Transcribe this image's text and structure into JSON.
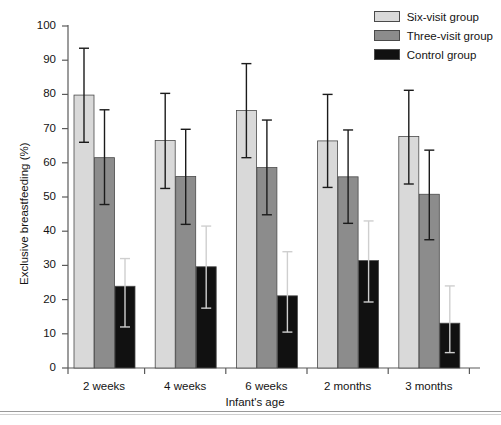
{
  "chart_data": {
    "type": "bar",
    "title": "",
    "xlabel": "Infant's age",
    "ylabel": "Exclusive breastfeeding (%)",
    "ylim": [
      0,
      100
    ],
    "ytick_step": 10,
    "yticks": [
      0,
      10,
      20,
      30,
      40,
      50,
      60,
      70,
      80,
      90,
      100
    ],
    "grid": false,
    "legend_position": "top-right",
    "categories": [
      "2 weeks",
      "4 weeks",
      "6 weeks",
      "2 months",
      "3 months"
    ],
    "series": [
      {
        "name": "Six-visit group",
        "color": "#d9d9d9",
        "values": [
          79.8,
          66.5,
          75.3,
          66.4,
          67.7
        ],
        "error_low": [
          66.0,
          52.5,
          61.5,
          52.8,
          53.8
        ],
        "error_high": [
          93.5,
          80.3,
          89.0,
          80.0,
          81.2
        ]
      },
      {
        "name": "Three-visit group",
        "color": "#8c8c8c",
        "values": [
          61.5,
          56.0,
          58.6,
          55.9,
          50.8
        ],
        "error_low": [
          47.8,
          42.0,
          44.8,
          42.3,
          37.5
        ],
        "error_high": [
          75.5,
          69.8,
          72.5,
          69.6,
          63.7
        ]
      },
      {
        "name": "Control group",
        "color": "#111111",
        "values": [
          23.9,
          29.6,
          21.1,
          31.4,
          13.1
        ],
        "error_low": [
          12.0,
          17.5,
          10.5,
          19.3,
          4.5
        ],
        "error_high": [
          32.0,
          41.5,
          34.0,
          43.0,
          24.0
        ]
      }
    ]
  },
  "legend": {
    "items": [
      {
        "label": "Six-visit group",
        "color": "#d9d9d9"
      },
      {
        "label": "Three-visit group",
        "color": "#8c8c8c"
      },
      {
        "label": "Control group",
        "color": "#111111"
      }
    ]
  }
}
